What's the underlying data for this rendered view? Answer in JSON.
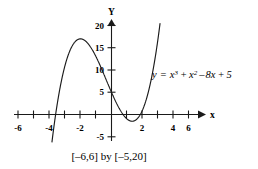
{
  "figure": {
    "name": "cubic-function-graph",
    "background_color": "#ffffff",
    "ink_color": "#1a1a1a",
    "caption": "[–6,6] by [–5,20]",
    "equation": {
      "lhs": "y",
      "equals": "=",
      "term1_base": "x",
      "term1_exp": "3",
      "plus1": "+",
      "term2_base": "x",
      "term2_exp": "2",
      "minus1": "–",
      "term3": "8x",
      "plus2": "+",
      "term4": "5",
      "full_text": "y = x³ + x² – 8x + 5"
    }
  },
  "chart_data": {
    "type": "line",
    "title": "",
    "subtitle": "",
    "annotations": [
      {
        "name": "equation-label",
        "text": "y = x³ + x² – 8x + 5",
        "x": 3.2,
        "y": 11.0
      },
      {
        "name": "window-caption",
        "text": "[–6,6] by [–5,20]",
        "x": 0.0,
        "y": -7.5
      }
    ],
    "xlabel": "x",
    "ylabel": "Y",
    "xlim": [
      -6,
      6
    ],
    "ylim": [
      -5,
      20
    ],
    "xticks": [
      -6,
      -5,
      -4,
      -3,
      -2,
      -1,
      1,
      2,
      3,
      4,
      5,
      6
    ],
    "xtick_labels_shown": [
      "-6",
      "-4",
      "-2",
      "2",
      "4",
      "6"
    ],
    "yticks": [
      -5,
      5,
      10,
      15,
      20
    ],
    "ytick_labels_shown": [
      "20",
      "15",
      "10",
      "5",
      "-5"
    ],
    "grid": false,
    "legend": false,
    "series": [
      {
        "name": "y = x^3 + x^2 - 8x + 5",
        "expression": "x**3 + x**2 - 8*x + 5",
        "x": [
          -4.2,
          -4.0,
          -3.8,
          -3.6,
          -3.4,
          -3.2,
          -3.0,
          -2.8,
          -2.6,
          -2.4,
          -2.2,
          -2.0,
          -1.8,
          -1.6,
          -1.4,
          -1.2,
          -1.0,
          -0.8,
          -0.6,
          -0.4,
          -0.2,
          0.0,
          0.2,
          0.4,
          0.6,
          0.8,
          1.0,
          1.2,
          1.4,
          1.6,
          1.8,
          2.0,
          2.2,
          2.4,
          2.6,
          2.8,
          3.0,
          3.2
        ],
        "y": [
          -17.9,
          -11.0,
          -4.9,
          0.5,
          5.2,
          9.1,
          11.0,
          13.3,
          15.0,
          16.0,
          16.6,
          16.8,
          16.8,
          16.4,
          15.8,
          15.1,
          14.0,
          12.7,
          11.2,
          9.7,
          8.0,
          5.0,
          3.4,
          1.8,
          0.4,
          -0.9,
          -1.0,
          -1.9,
          -2.5,
          -2.6,
          -2.3,
          -1.4,
          -0.1,
          1.9,
          4.6,
          8.1,
          11.0,
          18.4
        ],
        "local_max": {
          "x": -2.0,
          "y": 17.0
        },
        "local_min": {
          "x": 1.4,
          "y": -2.6
        },
        "y_intercept": 5,
        "visible_roots": [
          -3.7,
          0.7,
          1.9
        ]
      }
    ]
  }
}
